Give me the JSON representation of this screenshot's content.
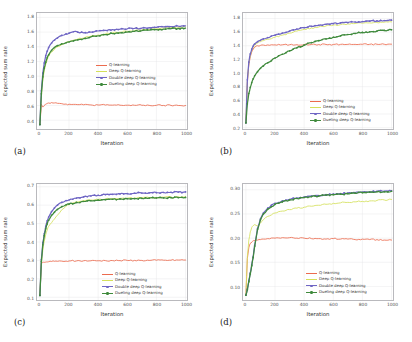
{
  "figure": {
    "panels": [
      {
        "key": "a",
        "letter": "(a)",
        "xlabel": "Iteration",
        "ylabel": "Expected sum rate",
        "xticks": [
          "0",
          "200",
          "400",
          "600",
          "800",
          "1000"
        ],
        "yticks": [
          "1.8",
          "1.6",
          "1.4",
          "1.2",
          "1.0",
          "0.8",
          "0.6",
          "0.4"
        ]
      },
      {
        "key": "b",
        "letter": "(b)",
        "xlabel": "Iteration",
        "ylabel": "Expected sum rate",
        "xticks": [
          "0",
          "200",
          "400",
          "600",
          "800",
          "1000"
        ],
        "yticks": [
          "1.8",
          "1.6",
          "1.4",
          "1.2",
          "1.0",
          "0.8",
          "0.6",
          "0.4",
          "0.2"
        ]
      },
      {
        "key": "c",
        "letter": "(c)",
        "xlabel": "Iteration",
        "ylabel": "Expected sum rate",
        "xticks": [
          "0",
          "200",
          "400",
          "600",
          "800",
          "1000"
        ],
        "yticks": [
          "0.7",
          "0.6",
          "0.5",
          "0.4",
          "0.3",
          "0.2",
          "0.1"
        ]
      },
      {
        "key": "d",
        "letter": "(d)",
        "xlabel": "Iteration",
        "ylabel": "Expected sum rate",
        "xticks": [
          "0",
          "200",
          "400",
          "600",
          "800",
          "1000"
        ],
        "yticks": [
          "0.30",
          "0.25",
          "0.20",
          "0.15",
          "0.10"
        ]
      }
    ],
    "legend_labels": [
      "Q-learning",
      "Deep Q-learning",
      "Double deep Q-learning",
      "Dueling deep Q-learning"
    ],
    "colors": {
      "q_learning": "#ec6b4e",
      "deep_q": "#d4e05a",
      "double_deep_q": "#6f66c4",
      "dueling_deep_q": "#3f8a3c"
    }
  },
  "chart_data": [
    {
      "type": "line",
      "panel": "a",
      "title": "",
      "xlabel": "Iteration",
      "ylabel": "Expected sum rate",
      "xlim": [
        -20,
        1010
      ],
      "ylim": [
        0.28,
        1.86
      ],
      "xticks": [
        0,
        200,
        400,
        600,
        800,
        1000
      ],
      "yticks": [
        0.4,
        0.6,
        0.8,
        1.0,
        1.2,
        1.4,
        1.6,
        1.8
      ],
      "grid": true,
      "legend_position": "center-right",
      "x": [
        0,
        10,
        20,
        30,
        40,
        50,
        60,
        80,
        100,
        120,
        150,
        180,
        200,
        230,
        260,
        300,
        350,
        400,
        450,
        500,
        550,
        600,
        650,
        700,
        750,
        800,
        850,
        900,
        950,
        1000
      ],
      "series": [
        {
          "name": "Q-learning",
          "color": "#ec6b4e",
          "values": [
            0.34,
            0.62,
            0.58,
            0.6,
            0.62,
            0.63,
            0.635,
            0.64,
            0.635,
            0.63,
            0.625,
            0.62,
            0.618,
            0.615,
            0.612,
            0.61,
            0.608,
            0.607,
            0.606,
            0.605,
            0.604,
            0.604,
            0.603,
            0.603,
            0.602,
            0.602,
            0.601,
            0.601,
            0.6,
            0.6
          ]
        },
        {
          "name": "Deep Q-learning",
          "color": "#d4e05a",
          "values": [
            0.34,
            0.72,
            0.95,
            1.08,
            1.16,
            1.22,
            1.27,
            1.33,
            1.37,
            1.4,
            1.43,
            1.46,
            1.47,
            1.49,
            1.505,
            1.52,
            1.545,
            1.56,
            1.575,
            1.59,
            1.6,
            1.61,
            1.62,
            1.63,
            1.64,
            1.645,
            1.655,
            1.66,
            1.665,
            1.67
          ]
        },
        {
          "name": "Double deep Q-learning",
          "color": "#6f66c4",
          "values": [
            0.34,
            0.8,
            1.04,
            1.18,
            1.28,
            1.34,
            1.39,
            1.45,
            1.49,
            1.52,
            1.555,
            1.575,
            1.585,
            1.605,
            1.6,
            1.59,
            1.6,
            1.615,
            1.625,
            1.635,
            1.64,
            1.645,
            1.65,
            1.655,
            1.66,
            1.665,
            1.67,
            1.675,
            1.68,
            1.685
          ]
        },
        {
          "name": "Dueling deep Q-learning",
          "color": "#3f8a3c",
          "values": [
            0.34,
            0.76,
            0.99,
            1.11,
            1.19,
            1.25,
            1.29,
            1.35,
            1.39,
            1.415,
            1.44,
            1.455,
            1.465,
            1.48,
            1.495,
            1.51,
            1.535,
            1.55,
            1.565,
            1.58,
            1.59,
            1.6,
            1.61,
            1.62,
            1.625,
            1.635,
            1.64,
            1.645,
            1.65,
            1.655
          ]
        }
      ]
    },
    {
      "type": "line",
      "panel": "b",
      "title": "",
      "xlabel": "Iteration",
      "ylabel": "Expected sum rate",
      "xlim": [
        -20,
        1010
      ],
      "ylim": [
        0.18,
        1.88
      ],
      "xticks": [
        0,
        200,
        400,
        600,
        800,
        1000
      ],
      "yticks": [
        0.2,
        0.4,
        0.6,
        0.8,
        1.0,
        1.2,
        1.4,
        1.6,
        1.8
      ],
      "grid": true,
      "legend_position": "lower-right",
      "x": [
        0,
        10,
        20,
        30,
        40,
        50,
        60,
        80,
        100,
        120,
        150,
        200,
        250,
        300,
        350,
        400,
        450,
        500,
        550,
        600,
        650,
        700,
        750,
        800,
        850,
        900,
        950,
        1000
      ],
      "series": [
        {
          "name": "Q-learning",
          "color": "#ec6b4e",
          "values": [
            0.27,
            0.86,
            1.12,
            1.24,
            1.31,
            1.35,
            1.375,
            1.4,
            1.405,
            1.41,
            1.412,
            1.413,
            1.414,
            1.415,
            1.416,
            1.417,
            1.418,
            1.418,
            1.419,
            1.419,
            1.42,
            1.42,
            1.42,
            1.421,
            1.421,
            1.422,
            1.422,
            1.423
          ]
        },
        {
          "name": "Deep Q-learning",
          "color": "#d4e05a",
          "values": [
            0.27,
            0.88,
            1.14,
            1.26,
            1.33,
            1.375,
            1.405,
            1.44,
            1.46,
            1.475,
            1.495,
            1.525,
            1.555,
            1.585,
            1.615,
            1.64,
            1.66,
            1.675,
            1.69,
            1.7,
            1.71,
            1.72,
            1.725,
            1.73,
            1.735,
            1.74,
            1.745,
            1.75
          ]
        },
        {
          "name": "Double deep Q-learning",
          "color": "#6f66c4",
          "values": [
            0.27,
            0.9,
            1.16,
            1.28,
            1.35,
            1.395,
            1.425,
            1.46,
            1.48,
            1.5,
            1.52,
            1.555,
            1.585,
            1.615,
            1.645,
            1.665,
            1.685,
            1.7,
            1.715,
            1.725,
            1.735,
            1.74,
            1.748,
            1.755,
            1.76,
            1.765,
            1.77,
            1.775
          ]
        },
        {
          "name": "Dueling deep Q-learning",
          "color": "#3f8a3c",
          "values": [
            0.27,
            0.55,
            0.7,
            0.79,
            0.86,
            0.915,
            0.96,
            1.02,
            1.07,
            1.105,
            1.15,
            1.22,
            1.275,
            1.325,
            1.37,
            1.41,
            1.445,
            1.475,
            1.5,
            1.525,
            1.545,
            1.565,
            1.58,
            1.595,
            1.605,
            1.615,
            1.625,
            1.635
          ]
        }
      ]
    },
    {
      "type": "line",
      "panel": "c",
      "title": "",
      "xlabel": "Iteration",
      "ylabel": "Expected sum rate",
      "xlim": [
        -20,
        1010
      ],
      "ylim": [
        0.085,
        0.715
      ],
      "xticks": [
        0,
        200,
        400,
        600,
        800,
        1000
      ],
      "yticks": [
        0.1,
        0.2,
        0.3,
        0.4,
        0.5,
        0.6,
        0.7
      ],
      "grid": true,
      "legend_position": "lower-right",
      "x": [
        0,
        10,
        20,
        30,
        40,
        50,
        60,
        80,
        100,
        120,
        150,
        180,
        200,
        250,
        300,
        350,
        400,
        450,
        500,
        550,
        600,
        650,
        700,
        750,
        800,
        850,
        900,
        950,
        1000
      ],
      "series": [
        {
          "name": "Q-learning",
          "color": "#ec6b4e",
          "values": [
            0.11,
            0.285,
            0.288,
            0.29,
            0.291,
            0.292,
            0.293,
            0.294,
            0.295,
            0.295,
            0.296,
            0.296,
            0.297,
            0.297,
            0.298,
            0.298,
            0.298,
            0.299,
            0.299,
            0.299,
            0.3,
            0.3,
            0.3,
            0.3,
            0.301,
            0.301,
            0.301,
            0.302,
            0.302
          ]
        },
        {
          "name": "Deep Q-learning",
          "color": "#d4e05a",
          "values": [
            0.11,
            0.285,
            0.355,
            0.405,
            0.44,
            0.465,
            0.485,
            0.505,
            0.525,
            0.545,
            0.575,
            0.595,
            0.603,
            0.618,
            0.625,
            0.628,
            0.631,
            0.633,
            0.635,
            0.637,
            0.638,
            0.639,
            0.64,
            0.641,
            0.642,
            0.643,
            0.644,
            0.645,
            0.645
          ]
        },
        {
          "name": "Double deep Q-learning",
          "color": "#6f66c4",
          "values": [
            0.11,
            0.305,
            0.395,
            0.445,
            0.485,
            0.515,
            0.535,
            0.565,
            0.585,
            0.6,
            0.615,
            0.625,
            0.628,
            0.638,
            0.645,
            0.65,
            0.654,
            0.657,
            0.659,
            0.661,
            0.663,
            0.665,
            0.666,
            0.667,
            0.668,
            0.669,
            0.67,
            0.671,
            0.672
          ]
        },
        {
          "name": "Dueling deep Q-learning",
          "color": "#3f8a3c",
          "values": [
            0.11,
            0.295,
            0.385,
            0.435,
            0.472,
            0.498,
            0.518,
            0.545,
            0.562,
            0.577,
            0.592,
            0.602,
            0.606,
            0.615,
            0.62,
            0.624,
            0.627,
            0.63,
            0.632,
            0.634,
            0.635,
            0.636,
            0.637,
            0.638,
            0.639,
            0.64,
            0.641,
            0.641,
            0.642
          ]
        }
      ]
    },
    {
      "type": "line",
      "panel": "d",
      "title": "",
      "xlabel": "Iteration",
      "ylabel": "Expected sum rate",
      "xlim": [
        -20,
        1010
      ],
      "ylim": [
        0.072,
        0.312
      ],
      "xticks": [
        0,
        200,
        400,
        600,
        800,
        1000
      ],
      "yticks": [
        0.1,
        0.15,
        0.2,
        0.25,
        0.3
      ],
      "grid": true,
      "legend_position": "lower-right",
      "x": [
        0,
        10,
        20,
        30,
        40,
        50,
        60,
        80,
        100,
        120,
        150,
        200,
        250,
        300,
        350,
        400,
        450,
        500,
        550,
        600,
        650,
        700,
        750,
        800,
        850,
        900,
        950,
        1000
      ],
      "series": [
        {
          "name": "Q-learning",
          "color": "#ec6b4e",
          "values": [
            0.082,
            0.158,
            0.18,
            0.189,
            0.192,
            0.194,
            0.195,
            0.196,
            0.197,
            0.198,
            0.199,
            0.2,
            0.201,
            0.201,
            0.2,
            0.2,
            0.199,
            0.199,
            0.198,
            0.199,
            0.198,
            0.198,
            0.197,
            0.198,
            0.197,
            0.197,
            0.196,
            0.196
          ]
        },
        {
          "name": "Deep Q-learning",
          "color": "#d4e05a",
          "values": [
            0.082,
            0.162,
            0.196,
            0.213,
            0.222,
            0.226,
            0.228,
            0.225,
            0.231,
            0.238,
            0.245,
            0.252,
            0.256,
            0.259,
            0.262,
            0.264,
            0.266,
            0.268,
            0.27,
            0.272,
            0.273,
            0.274,
            0.275,
            0.276,
            0.277,
            0.278,
            0.279,
            0.28
          ]
        },
        {
          "name": "Double deep Q-learning",
          "color": "#6f66c4",
          "values": [
            0.082,
            0.095,
            0.112,
            0.128,
            0.145,
            0.162,
            0.185,
            0.22,
            0.24,
            0.252,
            0.262,
            0.272,
            0.277,
            0.28,
            0.283,
            0.285,
            0.287,
            0.288,
            0.29,
            0.291,
            0.292,
            0.293,
            0.294,
            0.295,
            0.296,
            0.297,
            0.297,
            0.298
          ]
        },
        {
          "name": "Dueling deep Q-learning",
          "color": "#3f8a3c",
          "values": [
            0.082,
            0.093,
            0.11,
            0.126,
            0.143,
            0.16,
            0.183,
            0.218,
            0.238,
            0.25,
            0.26,
            0.27,
            0.275,
            0.279,
            0.282,
            0.284,
            0.286,
            0.287,
            0.289,
            0.29,
            0.291,
            0.292,
            0.293,
            0.294,
            0.295,
            0.296,
            0.296,
            0.297
          ]
        }
      ]
    }
  ]
}
